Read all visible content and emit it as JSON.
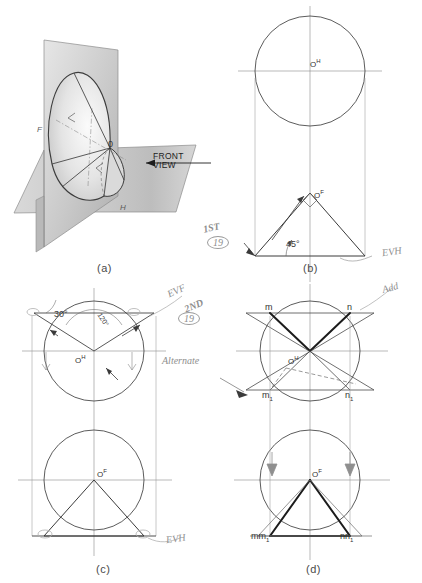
{
  "figure": {
    "panels": [
      {
        "id": "a",
        "caption": "(a)",
        "type": "pictorial"
      },
      {
        "id": "b",
        "caption": "(b)",
        "type": "orthographic"
      },
      {
        "id": "c",
        "caption": "(c)",
        "type": "orthographic"
      },
      {
        "id": "d",
        "caption": "(d)",
        "type": "orthographic"
      }
    ]
  },
  "panel_a": {
    "caption": "(a)",
    "plane_front_label": "F",
    "plane_horizontal_label": "H",
    "apex_label": "0",
    "view_direction": {
      "line1": "FRONT",
      "line2": "VIEW"
    }
  },
  "panel_b": {
    "caption": "(b)",
    "top_center_label": "O",
    "top_center_sup": "H",
    "front_center_label": "O",
    "front_center_sup": "F",
    "angle": "45°",
    "note_step": "1ST",
    "note_number": "19",
    "note_evh": "EVH"
  },
  "panel_c": {
    "caption": "(c)",
    "top_center_label": "O",
    "top_center_sup": "H",
    "front_center_label": "O",
    "front_center_sup": "F",
    "angle_30": "30°",
    "angle_120": "120°",
    "note_step": "2ND",
    "note_number": "19",
    "note_evf": "EVF",
    "note_evh": "EVH"
  },
  "panel_d": {
    "caption": "(d)",
    "center_label": "O",
    "center_sup": "H",
    "front_center_label": "O",
    "front_center_sup": "F",
    "point_m": "m",
    "point_n": "n",
    "point_m1": "m",
    "point_m1_sub": "1",
    "point_n1": "n",
    "point_n1_sub": "1",
    "front_left_label": "mm",
    "front_left_sub": "1",
    "front_right_label": "nn",
    "front_right_sub": "1",
    "note_add": "Add",
    "note_alternate": "Alternate"
  },
  "colors": {
    "ink": "#2b2b2b",
    "line": "#4a4a4a",
    "thin": "#8a8a8a",
    "pencil": "#9a9a9a",
    "shade_light": "#d8d8d8",
    "shade_mid": "#b8b8b8",
    "shade_dark": "#9c9c9c"
  }
}
